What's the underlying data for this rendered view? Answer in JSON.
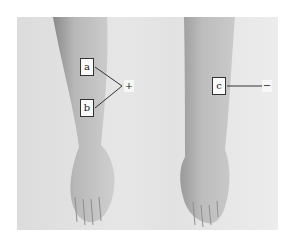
{
  "figure": {
    "left_panel": {
      "labels": [
        {
          "id": "a",
          "text": "a"
        },
        {
          "id": "b",
          "text": "b"
        }
      ],
      "sign": "+"
    },
    "right_panel": {
      "labels": [
        {
          "id": "c",
          "text": "c"
        }
      ],
      "sign": "−"
    }
  }
}
